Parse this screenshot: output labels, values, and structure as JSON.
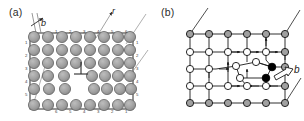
{
  "figure": {
    "panels": [
      {
        "id": "a",
        "label": "(a)",
        "kind": "atomistic-lattice-dislocation",
        "description": "Array of grey atoms arranged on a rectangular lattice with a rectangular boundary frame; an inverted-T dislocation symbol sits in the interior and a missing half-plane of atoms appears on the lower left. Boundary atoms are numbered and diagonal guide lines labelled b and r point to the frame.",
        "atom_color": "#9d9d9d",
        "atom_edge_color": "#4a4a4a",
        "frame_color": "#2a2a2a",
        "rows": 6,
        "columns": 8,
        "dislocation_symbol": "⊥",
        "annotations": [
          {
            "name": "burgers-vector-arrow",
            "label": "b",
            "position": "top-left"
          },
          {
            "name": "radius-arrow",
            "label": "r",
            "position": "top-center"
          }
        ],
        "edge_numbers": {
          "top": [
            "1",
            "2",
            "3",
            "4",
            "5",
            "6"
          ],
          "right": [
            "1",
            "2",
            "3",
            "4",
            "5"
          ],
          "bottom": [
            "6",
            "5",
            "4",
            "3",
            "2",
            "1"
          ],
          "left": [
            "1",
            "2",
            "3",
            "4",
            "5"
          ]
        }
      },
      {
        "id": "b",
        "label": "(b)",
        "kind": "discrete-lattice-network-dislocation",
        "description": "Square network of nodes joined by bonds; boundary nodes are grey, interior nodes white and two core nodes solid black. Small solid arrowheads mark relative bond displacements around the dislocation core and a large hollow arrow labelled b indicates the Burgers vector direction.",
        "node_fill_boundary": "#9d9d9d",
        "node_fill_interior": "#ffffff",
        "node_fill_core": "#000000",
        "bond_color": "#1a1a1a",
        "rows": 5,
        "columns": 6,
        "annotations": [
          {
            "name": "burgers-vector-arrow",
            "label": "b",
            "position": "right"
          }
        ]
      }
    ]
  }
}
